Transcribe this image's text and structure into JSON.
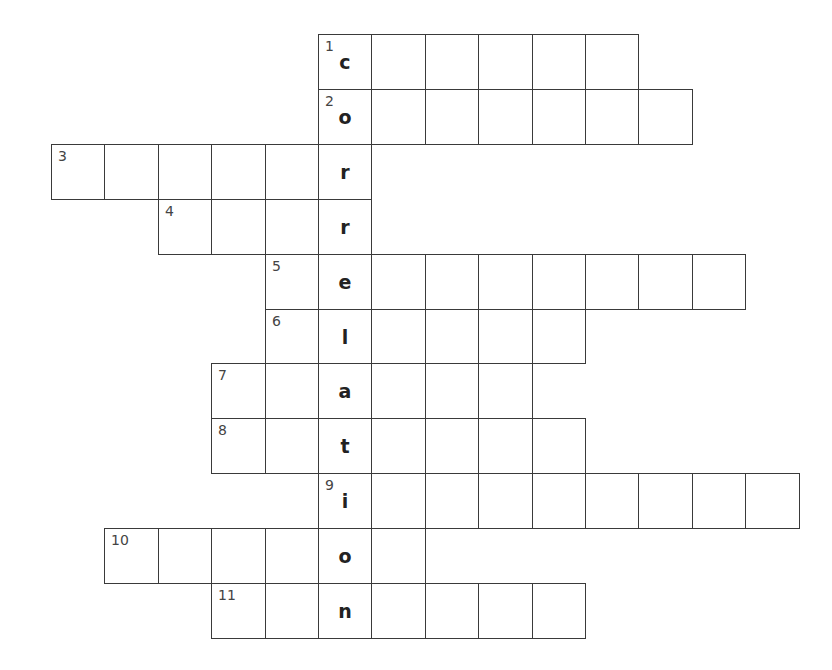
{
  "puzzle": {
    "keyword": "correlation",
    "origin_x": 51,
    "origin_y": 34,
    "cell_w": 53.4,
    "cell_h": 54.9,
    "key_column": 5,
    "rows": [
      {
        "number": "1",
        "start_col": 5,
        "length": 6,
        "key_letter": "c"
      },
      {
        "number": "2",
        "start_col": 5,
        "length": 7,
        "key_letter": "o"
      },
      {
        "number": "3",
        "start_col": 0,
        "length": 6,
        "key_letter": "r"
      },
      {
        "number": "4",
        "start_col": 2,
        "length": 4,
        "key_letter": "r"
      },
      {
        "number": "5",
        "start_col": 4,
        "length": 9,
        "key_letter": "e"
      },
      {
        "number": "6",
        "start_col": 4,
        "length": 6,
        "key_letter": "l"
      },
      {
        "number": "7",
        "start_col": 3,
        "length": 6,
        "key_letter": "a"
      },
      {
        "number": "8",
        "start_col": 3,
        "length": 7,
        "key_letter": "t"
      },
      {
        "number": "9",
        "start_col": 5,
        "length": 9,
        "key_letter": "i"
      },
      {
        "number": "10",
        "start_col": 1,
        "length": 6,
        "key_letter": "o"
      },
      {
        "number": "11",
        "start_col": 3,
        "length": 7,
        "key_letter": "n"
      }
    ]
  }
}
